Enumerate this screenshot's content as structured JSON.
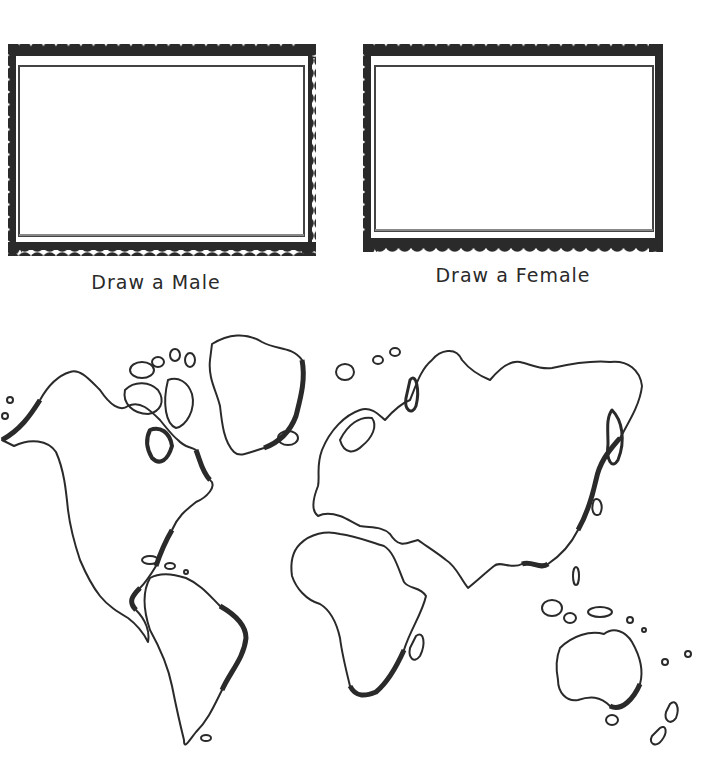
{
  "worksheet": {
    "frames": [
      {
        "id": "male",
        "label": "Draw a Male"
      },
      {
        "id": "female",
        "label": "Draw a Female"
      }
    ],
    "map": {
      "subject": "world-outline-map"
    },
    "colors": {
      "ink": "#2a2a2a",
      "paper": "#ffffff"
    }
  }
}
